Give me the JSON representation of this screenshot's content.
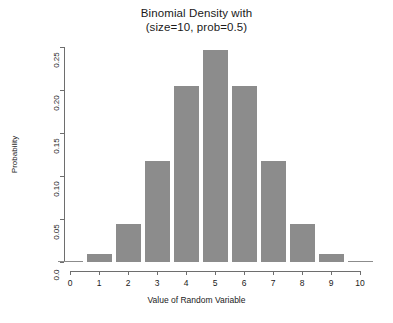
{
  "chart_data": {
    "type": "bar",
    "title": "Binomial Density with (size=10, prob=0.5)",
    "title_lines": [
      "Binomial Density with",
      "(size=10, prob=0.5)"
    ],
    "xlabel": "Value of Random Variable",
    "ylabel": "Probability",
    "categories": [
      0,
      1,
      2,
      3,
      4,
      5,
      6,
      7,
      8,
      9,
      10
    ],
    "values": [
      0.001,
      0.0098,
      0.0439,
      0.1172,
      0.2051,
      0.2461,
      0.2051,
      0.1172,
      0.0439,
      0.0098,
      0.001
    ],
    "xlim": [
      0,
      10
    ],
    "ylim": [
      0,
      0.25
    ],
    "x_ticks": [
      "0",
      "1",
      "2",
      "3",
      "4",
      "5",
      "6",
      "7",
      "8",
      "9",
      "10"
    ],
    "y_ticks": [
      "0.0",
      "0.05",
      "0.10",
      "0.15",
      "0.20",
      "0.25"
    ],
    "y_tick_values": [
      0.0,
      0.05,
      0.1,
      0.15,
      0.2,
      0.25
    ],
    "grid": false,
    "legend": null,
    "bar_color": "#8c8c8c",
    "axis_color": "#6e6e6e",
    "background_color": "#ffffff"
  }
}
